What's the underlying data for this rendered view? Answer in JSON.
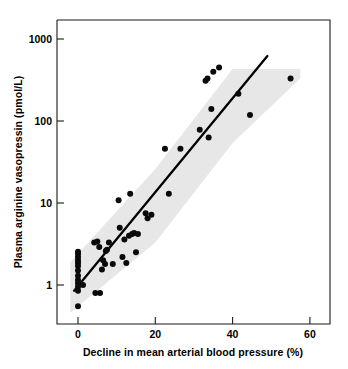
{
  "chart_data": {
    "type": "scatter",
    "title": "",
    "xlabel": "Decline in mean arterial blood pressure (%)",
    "ylabel": "Plasma arginine vasopressin (pmol/L)",
    "xscale": "linear",
    "yscale": "log",
    "xlim": [
      -3.5,
      65
    ],
    "ylim": [
      0.42,
      2000
    ],
    "xticks": [
      0,
      20,
      40,
      60
    ],
    "xticklabels": [
      "0",
      "20",
      "40",
      "60"
    ],
    "yticks": [
      1,
      10,
      100,
      1000
    ],
    "yticklabels": [
      "1",
      "10",
      "100",
      "1000"
    ],
    "grid": false,
    "legend": null,
    "series": [
      {
        "name": "Subjects",
        "marker": "filled-circle",
        "color": "#0a0a0a",
        "points": [
          [
            0.0,
            0.55
          ],
          [
            0.0,
            0.85
          ],
          [
            0.0,
            0.95
          ],
          [
            0.0,
            1.05
          ],
          [
            0.0,
            1.15
          ],
          [
            0.0,
            1.3
          ],
          [
            0.0,
            1.5
          ],
          [
            0.0,
            1.7
          ],
          [
            0.0,
            1.85
          ],
          [
            0.0,
            2.0
          ],
          [
            0.0,
            2.2
          ],
          [
            0.0,
            2.4
          ],
          [
            0.0,
            2.55
          ],
          [
            1.3,
            1.0
          ],
          [
            4.5,
            0.8
          ],
          [
            5.7,
            0.8
          ],
          [
            4.2,
            3.3
          ],
          [
            5.0,
            3.4
          ],
          [
            5.5,
            2.9
          ],
          [
            6.2,
            1.55
          ],
          [
            6.5,
            2.0
          ],
          [
            7.0,
            1.8
          ],
          [
            7.2,
            2.6
          ],
          [
            7.5,
            2.7
          ],
          [
            8.0,
            3.3
          ],
          [
            9.0,
            1.8
          ],
          [
            10.5,
            10.8
          ],
          [
            10.8,
            5.0
          ],
          [
            11.5,
            2.2
          ],
          [
            12.0,
            3.6
          ],
          [
            12.5,
            1.85
          ],
          [
            13.2,
            4.0
          ],
          [
            13.5,
            13.0
          ],
          [
            14.0,
            4.2
          ],
          [
            14.5,
            4.3
          ],
          [
            15.0,
            2.5
          ],
          [
            15.5,
            4.2
          ],
          [
            17.5,
            7.5
          ],
          [
            18.0,
            6.5
          ],
          [
            19.0,
            7.2
          ],
          [
            22.5,
            46.0
          ],
          [
            23.5,
            13.0
          ],
          [
            26.5,
            46.0
          ],
          [
            31.5,
            78.0
          ],
          [
            33.0,
            310.0
          ],
          [
            33.5,
            330.0
          ],
          [
            33.8,
            63.0
          ],
          [
            34.5,
            140.0
          ],
          [
            35.0,
            400.0
          ],
          [
            36.5,
            450.0
          ],
          [
            41.5,
            215.0
          ],
          [
            44.5,
            118.0
          ],
          [
            55.0,
            330.0
          ]
        ]
      }
    ],
    "regression_line": {
      "label": "regression",
      "x_start": -1.0,
      "y_start": 0.85,
      "x_end": 49.0,
      "y_end": 620.0
    },
    "confidence_band": {
      "label": "95% confidence band",
      "color": "#d8d8d8",
      "upper": [
        [
          -2.0,
          1.9
        ],
        [
          20.0,
          26.0
        ],
        [
          40.0,
          430.0
        ],
        [
          57.5,
          430.0
        ]
      ],
      "lower": [
        [
          -2.0,
          0.46
        ],
        [
          20.0,
          3.3
        ],
        [
          40.0,
          54.0
        ],
        [
          57.5,
          330.0
        ]
      ]
    }
  }
}
